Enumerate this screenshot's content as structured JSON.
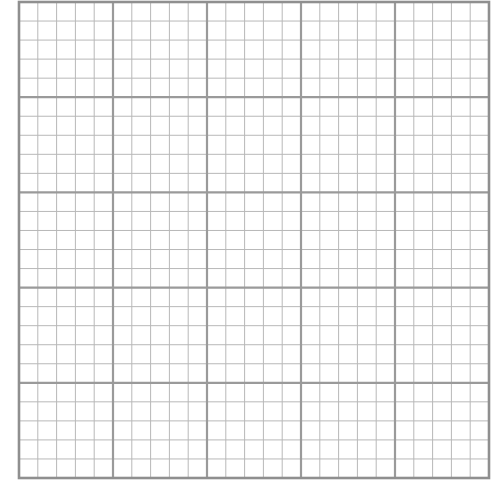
{
  "graph_paper": {
    "origin_x": 19,
    "origin_y": 2,
    "width": 470,
    "height": 476,
    "major_divisions_x": 5,
    "major_divisions_y": 5,
    "minor_per_major": 5,
    "colors": {
      "background": "#ffffff",
      "major_line": "#9a9a9a",
      "minor_line": "#b8b8b8",
      "border": "#8f8f8f"
    },
    "line_widths": {
      "major": 2.2,
      "minor": 1,
      "border": 2.6
    }
  }
}
